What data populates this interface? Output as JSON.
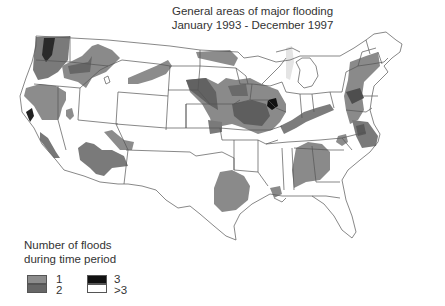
{
  "title": {
    "line1": "General areas of major flooding",
    "line2": "January 1993 - December 1997"
  },
  "legend": {
    "heading_line1": "Number of floods",
    "heading_line2": "during time period",
    "items": [
      {
        "label": "1",
        "color": "#8c8c8c"
      },
      {
        "label": "2",
        "color": "#666666"
      },
      {
        "label": "3",
        "color": "#111111"
      },
      {
        "label": ">3",
        "color": "#ffffff"
      }
    ]
  },
  "colors": {
    "background": "#ffffff",
    "state_border": "#555555",
    "flood_1": "#8c8c8c",
    "flood_2": "#666666",
    "flood_3": "#111111",
    "lake": "#e4e4e4"
  },
  "map": {
    "region": "Contiguous United States",
    "flood_areas": [
      {
        "area": "Western Washington",
        "count": "1-3"
      },
      {
        "area": "Oregon / Idaho Snake River",
        "count": "1-2"
      },
      {
        "area": "Northern California",
        "count": "1-3"
      },
      {
        "area": "Southern California",
        "count": "1-2"
      },
      {
        "area": "Arizona",
        "count": "1-2"
      },
      {
        "area": "Montana",
        "count": "1"
      },
      {
        "area": "North Dakota Red River",
        "count": "1"
      },
      {
        "area": "Upper Mississippi / Missouri Basin",
        "count": "1-3"
      },
      {
        "area": "Ohio River",
        "count": "1-2"
      },
      {
        "area": "East Texas",
        "count": "1"
      },
      {
        "area": "Alabama / Georgia",
        "count": "1"
      },
      {
        "area": "Mid-Atlantic / Pennsylvania",
        "count": "1-2"
      },
      {
        "area": "North Carolina",
        "count": "1-2"
      }
    ]
  }
}
